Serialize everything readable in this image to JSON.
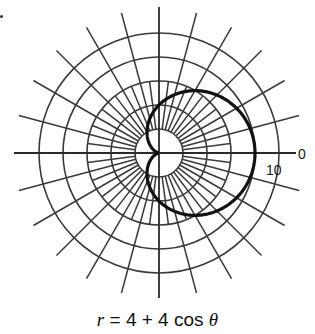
{
  "chart_data": {
    "type": "line",
    "subtype": "polar",
    "title": "r = 4 + 4 cos θ",
    "equation": {
      "a": 4,
      "b": 4,
      "function": "cos"
    },
    "curve_name": "cardioid",
    "polar_grid": {
      "ring_values": [
        2,
        4,
        6,
        8,
        10
      ],
      "radial_spacing_deg": 15,
      "inner_radial_spacing_deg": 7.5,
      "rmax": 10
    },
    "tick_labels": {
      "angle_zero": "0",
      "radius_ten": "10"
    },
    "x": [
      0,
      30,
      60,
      90,
      120,
      150,
      180,
      210,
      240,
      270,
      300,
      330,
      360
    ],
    "values": [
      8,
      7.46,
      6,
      4,
      2,
      0.54,
      0,
      0.54,
      2,
      4,
      6,
      7.46,
      8
    ],
    "xlabel": "θ (degrees)",
    "ylabel": "r"
  },
  "labels": {
    "angle_zero": "0",
    "radius_ten": "10",
    "caption_var": "r",
    "caption_rest": " = 4 + 4 cos ",
    "caption_theta": "θ"
  },
  "layout": {
    "cx": 159,
    "cy": 153,
    "px_per_unit": 12,
    "ray_outer_px": 145,
    "axis_left_px": 145,
    "axis_right_px": 137,
    "axis_top_px": 146,
    "axis_bottom_px": 145
  }
}
